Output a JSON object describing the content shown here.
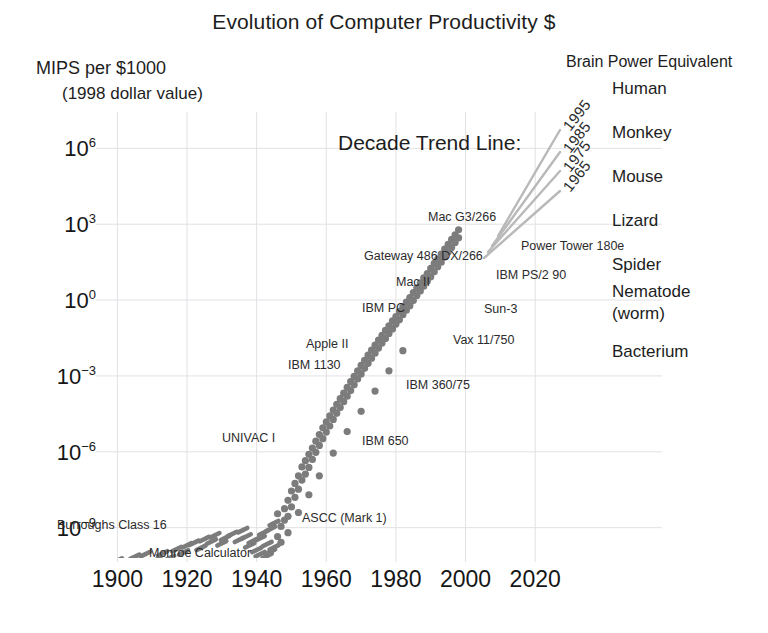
{
  "chart_data": {
    "type": "scatter",
    "title": "Evolution of Computer Productivity $",
    "ylabel": "MIPS per $1000",
    "ylabel_sub": "(1998 dollar value)",
    "xlabel": "",
    "xlim": [
      1895,
      2030
    ],
    "ylim_log10": [
      -10.2,
      7.2
    ],
    "grid": true,
    "yticks": [
      {
        "label_base": "10",
        "label_exp": "6",
        "value_log10": 6
      },
      {
        "label_base": "10",
        "label_exp": "3",
        "value_log10": 3
      },
      {
        "label_base": "10",
        "label_exp": "0",
        "value_log10": 0
      },
      {
        "label_base": "10",
        "label_exp": "−3",
        "value_log10": -3
      },
      {
        "label_base": "10",
        "label_exp": "−6",
        "value_log10": -6
      },
      {
        "label_base": "10",
        "label_exp": "−9",
        "value_log10": -9
      }
    ],
    "xticks": [
      1900,
      1920,
      1940,
      1960,
      1980,
      2000,
      2020
    ],
    "point_color": "#7c7c7c",
    "grid_color": "#e2e2e6",
    "series": [
      {
        "name": "Computing devices",
        "points": [
          [
            1900,
            -10.3
          ],
          [
            1903,
            -10.45
          ],
          [
            1905,
            -10.15
          ],
          [
            1907,
            -10.38
          ],
          [
            1908,
            -10.05
          ],
          [
            1911,
            -10.28
          ],
          [
            1913,
            -10.02
          ],
          [
            1915,
            -10.2
          ],
          [
            1917,
            -9.85
          ],
          [
            1919,
            -9.98
          ],
          [
            1920,
            -9.7
          ],
          [
            1922,
            -9.6
          ],
          [
            1924,
            -9.8
          ],
          [
            1925,
            -9.45
          ],
          [
            1927,
            -9.55
          ],
          [
            1928,
            -9.3
          ],
          [
            1930,
            -9.62
          ],
          [
            1931,
            -9.4
          ],
          [
            1933,
            -9.25
          ],
          [
            1935,
            -9.48
          ],
          [
            1936,
            -9.1
          ],
          [
            1937,
            -9.35
          ],
          [
            1938,
            -9.7
          ],
          [
            1939,
            -9.52
          ],
          [
            1940,
            -9.88
          ],
          [
            1941,
            -9.42
          ],
          [
            1941,
            -10.05
          ],
          [
            1942,
            -9.2
          ],
          [
            1943,
            -9.65
          ],
          [
            1943,
            -10.12
          ],
          [
            1944,
            -9.95
          ],
          [
            1944,
            -9.05
          ],
          [
            1945,
            -9.78
          ],
          [
            1945,
            -8.82
          ],
          [
            1946,
            -9.35
          ],
          [
            1946,
            -8.45
          ],
          [
            1947,
            -8.95
          ],
          [
            1947,
            -9.58
          ],
          [
            1948,
            -8.25
          ],
          [
            1948,
            -8.7
          ],
          [
            1949,
            -7.92
          ],
          [
            1949,
            -8.55
          ],
          [
            1950,
            -7.55
          ],
          [
            1950,
            -8.18
          ],
          [
            1951,
            -7.25
          ],
          [
            1951,
            -7.8
          ],
          [
            1952,
            -6.95
          ],
          [
            1952,
            -7.48
          ],
          [
            1953,
            -6.6
          ],
          [
            1953,
            -7.12
          ],
          [
            1954,
            -6.35
          ],
          [
            1954,
            -6.88
          ],
          [
            1955,
            -6.1
          ],
          [
            1955,
            -6.62
          ],
          [
            1956,
            -5.85
          ],
          [
            1956,
            -6.3
          ],
          [
            1957,
            -5.58
          ],
          [
            1957,
            -6.02
          ],
          [
            1958,
            -5.32
          ],
          [
            1958,
            -5.75
          ],
          [
            1959,
            -5.05
          ],
          [
            1959,
            -5.48
          ],
          [
            1960,
            -4.82
          ],
          [
            1960,
            -5.22
          ],
          [
            1961,
            -4.58
          ],
          [
            1961,
            -4.98
          ],
          [
            1962,
            -4.35
          ],
          [
            1962,
            -4.72
          ],
          [
            1963,
            -4.12
          ],
          [
            1963,
            -4.48
          ],
          [
            1964,
            -3.9
          ],
          [
            1964,
            -4.25
          ],
          [
            1965,
            -3.68
          ],
          [
            1965,
            -4.02
          ],
          [
            1966,
            -3.45
          ],
          [
            1966,
            -3.8
          ],
          [
            1967,
            -3.22
          ],
          [
            1967,
            -3.58
          ],
          [
            1968,
            -3.02
          ],
          [
            1968,
            -3.35
          ],
          [
            1969,
            -2.8
          ],
          [
            1969,
            -3.12
          ],
          [
            1970,
            -2.58
          ],
          [
            1970,
            -2.92
          ],
          [
            1971,
            -2.38
          ],
          [
            1971,
            -2.7
          ],
          [
            1972,
            -2.18
          ],
          [
            1972,
            -2.5
          ],
          [
            1973,
            -1.98
          ],
          [
            1973,
            -2.3
          ],
          [
            1974,
            -1.78
          ],
          [
            1974,
            -2.1
          ],
          [
            1975,
            -1.58
          ],
          [
            1975,
            -1.9
          ],
          [
            1976,
            -1.4
          ],
          [
            1976,
            -1.7
          ],
          [
            1977,
            -1.2
          ],
          [
            1977,
            -1.52
          ],
          [
            1978,
            -1.02
          ],
          [
            1978,
            -1.32
          ],
          [
            1979,
            -0.82
          ],
          [
            1979,
            -1.14
          ],
          [
            1980,
            -0.65
          ],
          [
            1980,
            -0.95
          ],
          [
            1981,
            -0.45
          ],
          [
            1981,
            -0.78
          ],
          [
            1982,
            -0.28
          ],
          [
            1982,
            -0.58
          ],
          [
            1983,
            -0.08
          ],
          [
            1983,
            -0.4
          ],
          [
            1984,
            0.1
          ],
          [
            1984,
            -0.22
          ],
          [
            1985,
            0.3
          ],
          [
            1985,
            -0.02
          ],
          [
            1986,
            0.48
          ],
          [
            1986,
            0.18
          ],
          [
            1987,
            0.68
          ],
          [
            1987,
            0.36
          ],
          [
            1988,
            0.88
          ],
          [
            1988,
            0.55
          ],
          [
            1989,
            1.05
          ],
          [
            1989,
            0.74
          ],
          [
            1990,
            1.25
          ],
          [
            1990,
            0.92
          ],
          [
            1991,
            1.45
          ],
          [
            1991,
            1.12
          ],
          [
            1992,
            1.62
          ],
          [
            1992,
            1.32
          ],
          [
            1993,
            1.82
          ],
          [
            1993,
            1.5
          ],
          [
            1994,
            2.02
          ],
          [
            1994,
            1.7
          ],
          [
            1995,
            2.2
          ],
          [
            1995,
            1.9
          ],
          [
            1996,
            2.4
          ],
          [
            1996,
            2.08
          ],
          [
            1997,
            2.58
          ],
          [
            1997,
            2.28
          ],
          [
            1998,
            2.78
          ],
          [
            1998,
            2.46
          ],
          [
            1962,
            -6.05
          ],
          [
            1958,
            -6.95
          ],
          [
            1955,
            -7.7
          ],
          [
            1952,
            -8.4
          ],
          [
            1949,
            -9.2
          ],
          [
            1966,
            -5.2
          ],
          [
            1970,
            -4.4
          ],
          [
            1974,
            -3.6
          ],
          [
            1978,
            -2.8
          ],
          [
            1982,
            -2.0
          ]
        ]
      }
    ],
    "annotations": [
      {
        "text": "Mac G3/266",
        "x_px": 428,
        "y_px": 211,
        "align": "left"
      },
      {
        "text": "Power Tower 180e",
        "x_px": 521,
        "y_px": 240,
        "align": "left"
      },
      {
        "text": "Gateway 486 DX/266",
        "x_px": 364,
        "y_px": 250,
        "align": "left"
      },
      {
        "text": "IBM PS/2 90",
        "x_px": 496,
        "y_px": 269,
        "align": "left"
      },
      {
        "text": "Mac II",
        "x_px": 396,
        "y_px": 276,
        "align": "left"
      },
      {
        "text": "IBM PC",
        "x_px": 362,
        "y_px": 302,
        "align": "left"
      },
      {
        "text": "Sun-3",
        "x_px": 484,
        "y_px": 303,
        "align": "left"
      },
      {
        "text": "Vax 11/750",
        "x_px": 453,
        "y_px": 334,
        "align": "left"
      },
      {
        "text": "Apple II",
        "x_px": 306,
        "y_px": 338,
        "align": "left"
      },
      {
        "text": "IBM 1130",
        "x_px": 288,
        "y_px": 359,
        "align": "left"
      },
      {
        "text": "IBM 360/75",
        "x_px": 406,
        "y_px": 379,
        "align": "left"
      },
      {
        "text": "UNIVAC I",
        "x_px": 222,
        "y_px": 432,
        "align": "left"
      },
      {
        "text": "IBM 650",
        "x_px": 362,
        "y_px": 435,
        "align": "left"
      },
      {
        "text": "ASCC (Mark 1)",
        "x_px": 302,
        "y_px": 512,
        "align": "left"
      },
      {
        "text": "Burroughs Class 16",
        "x_px": 57,
        "y_px": 519,
        "align": "left"
      },
      {
        "text": "Monroe Calculator",
        "x_px": 149,
        "y_px": 547,
        "align": "left"
      }
    ],
    "decade_trend": {
      "caption": "Decade Trend Line:",
      "line_color": "#b9b9b9",
      "years": [
        {
          "label": "1995",
          "x_px": 566,
          "y_px": 120
        },
        {
          "label": "1985",
          "x_px": 566,
          "y_px": 142
        },
        {
          "label": "1975",
          "x_px": 566,
          "y_px": 161
        },
        {
          "label": "1965",
          "x_px": 566,
          "y_px": 181
        }
      ]
    },
    "brain_power": {
      "heading": "Brain Power Equivalent",
      "items": [
        {
          "label": "Human",
          "y_px": 78
        },
        {
          "label": "Monkey",
          "y_px": 122
        },
        {
          "label": "Mouse",
          "y_px": 166
        },
        {
          "label": "Lizard",
          "y_px": 210
        },
        {
          "label": "Spider",
          "y_px": 254
        },
        {
          "label": "Nematode",
          "y_px": 281
        },
        {
          "label": "(worm)",
          "y_px": 303
        },
        {
          "label": "Bacterium",
          "y_px": 341
        }
      ]
    }
  }
}
